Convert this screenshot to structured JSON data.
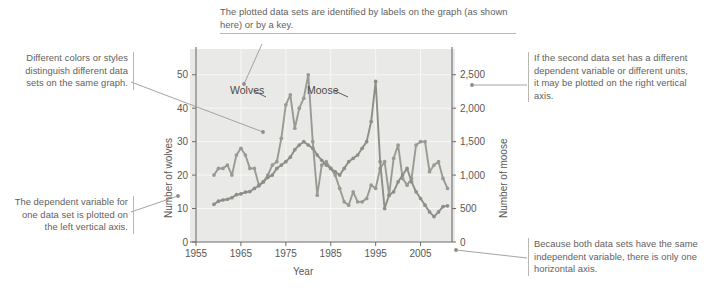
{
  "figure": {
    "background": "#ffffff",
    "plot_background": "#e9e9e7",
    "annotation_color": "#63605e",
    "rule_color": "#b9b6b3"
  },
  "annotations": {
    "top": "The plotted data sets are identified by labels on the graph (as shown here) or by a key.",
    "left_upper": "Different colors or styles distinguish different data sets on the same graph.",
    "left_lower": "The dependent variable for one data set is plotted on the left vertical axis.",
    "right_upper": "If the second data set has a different dependent variable or different units, it may be plotted on the right vertical axis.",
    "right_lower": "Because both data sets have the same independent variable, there is only one horizontal axis."
  },
  "chart_data": {
    "type": "line",
    "title": "",
    "xlabel": "Year",
    "ylabel": "Number of wolves",
    "y2label": "Number of moose",
    "xlim": [
      1955,
      2012
    ],
    "ylim": [
      0,
      55
    ],
    "y2lim": [
      0,
      2750
    ],
    "xticks": [
      "1955",
      "1965",
      "1975",
      "1985",
      "1995",
      "2005"
    ],
    "xtick_values": [
      1955,
      1965,
      1975,
      1985,
      1995,
      2005
    ],
    "yticks": [
      "0",
      "10",
      "20",
      "30",
      "40",
      "50"
    ],
    "ytick_values": [
      0,
      10,
      20,
      30,
      40,
      50
    ],
    "y2ticks": [
      "0",
      "500",
      "1,000",
      "1,500",
      "2,000",
      "2,500"
    ],
    "y2tick_values": [
      0,
      500,
      1000,
      1500,
      2000,
      2500
    ],
    "grid": true,
    "legend_position": "inline-labels",
    "series": [
      {
        "name": "Wolves",
        "label": "Wolves",
        "axis": "left",
        "color": "#9a9a92",
        "marker": "circle",
        "x": [
          1959,
          1960,
          1961,
          1962,
          1963,
          1964,
          1965,
          1966,
          1967,
          1968,
          1969,
          1970,
          1971,
          1972,
          1973,
          1974,
          1975,
          1976,
          1977,
          1978,
          1979,
          1980,
          1981,
          1982,
          1983,
          1984,
          1985,
          1986,
          1987,
          1988,
          1989,
          1990,
          1991,
          1992,
          1993,
          1994,
          1995,
          1996,
          1997,
          1998,
          1999,
          2000,
          2001,
          2002,
          2003,
          2004,
          2005,
          2006,
          2007,
          2008,
          2009,
          2010,
          2011
        ],
        "y": [
          20,
          22,
          22,
          23,
          20,
          26,
          28,
          26,
          22,
          22,
          17,
          18,
          20,
          23,
          24,
          31,
          41,
          44,
          34,
          40,
          43,
          50,
          30,
          14,
          23,
          24,
          22,
          20,
          16,
          12,
          11,
          15,
          12,
          12,
          13,
          17,
          16,
          22,
          24,
          14,
          25,
          29,
          19,
          17,
          19,
          29,
          30,
          30,
          21,
          23,
          24,
          19,
          16
        ]
      },
      {
        "name": "Moose",
        "label": "Moose",
        "axis": "right",
        "color": "#8d8f87",
        "marker": "circle",
        "x": [
          1959,
          1960,
          1961,
          1962,
          1963,
          1964,
          1965,
          1966,
          1967,
          1968,
          1969,
          1970,
          1971,
          1972,
          1973,
          1974,
          1975,
          1976,
          1977,
          1978,
          1979,
          1980,
          1981,
          1982,
          1983,
          1984,
          1985,
          1986,
          1987,
          1988,
          1989,
          1990,
          1991,
          1992,
          1993,
          1994,
          1995,
          1996,
          1997,
          1998,
          1999,
          2000,
          2001,
          2002,
          2003,
          2004,
          2005,
          2006,
          2007,
          2008,
          2009,
          2010,
          2011
        ],
        "y": [
          563,
          610,
          628,
          639,
          663,
          707,
          718,
          744,
          754,
          800,
          840,
          900,
          966,
          1000,
          1100,
          1150,
          1200,
          1268,
          1380,
          1450,
          1500,
          1450,
          1400,
          1300,
          1220,
          1150,
          1100,
          1050,
          1000,
          1100,
          1200,
          1250,
          1300,
          1400,
          1500,
          1800,
          2400,
          1200,
          500,
          700,
          750,
          900,
          1000,
          1100,
          900,
          750,
          650,
          550,
          450,
          380,
          450,
          530,
          540
        ]
      }
    ]
  }
}
